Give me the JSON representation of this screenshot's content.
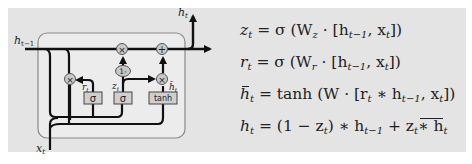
{
  "diagram": {
    "labels": {
      "h_prev": "h",
      "h_prev_sub": "t−1",
      "h_out": "h",
      "h_out_sub": "t",
      "x_in": "x",
      "x_in_sub": "t",
      "r_gate": "r",
      "r_gate_sub": "t",
      "z_gate": "z",
      "z_gate_sub": "t",
      "h_tilde": "h̃",
      "h_tilde_sub": "t"
    },
    "ops": {
      "multiply": "×",
      "add": "+",
      "one_minus": "1-"
    },
    "boxes": {
      "sigma_r": "σ",
      "sigma_z": "σ",
      "tanh": "tanh"
    }
  },
  "equations": [
    {
      "lhs": "z",
      "lhs_sub": "t",
      "rhs": "= σ (W",
      "w_sub": "z",
      "rest": " · [h",
      "h_sub": "t−1",
      "tail": ", x",
      "x_sub": "t",
      "end": "])"
    },
    {
      "lhs": "r",
      "lhs_sub": "t",
      "rhs": "= σ (W",
      "w_sub": "r",
      "rest": " · [h",
      "h_sub": "t−1",
      "tail": ", x",
      "x_sub": "t",
      "end": "])"
    },
    {
      "lhs": "h",
      "lhs_sub": "t",
      "rhs": "= tanh (W · [r",
      "r_sub": "t",
      "rest": " ∗ h",
      "h_sub": "t−1",
      "tail": ", x",
      "x_sub": "t",
      "end": "])"
    },
    {
      "lhs": "h",
      "lhs_sub": "t",
      "rhs": "= (1 − z",
      "z_sub": "t",
      "rest": ") ∗ h",
      "h_sub": "t−1",
      "tail": " + z",
      "z2_sub": "t",
      "end": " ∗ h",
      "end_sub": "t"
    }
  ],
  "colors": {
    "panel": "#e4e4e4",
    "cell": "#ececec",
    "line": "#111111",
    "gate_fill": "#c8c8c8",
    "box_fill": "#cfcfcf"
  }
}
